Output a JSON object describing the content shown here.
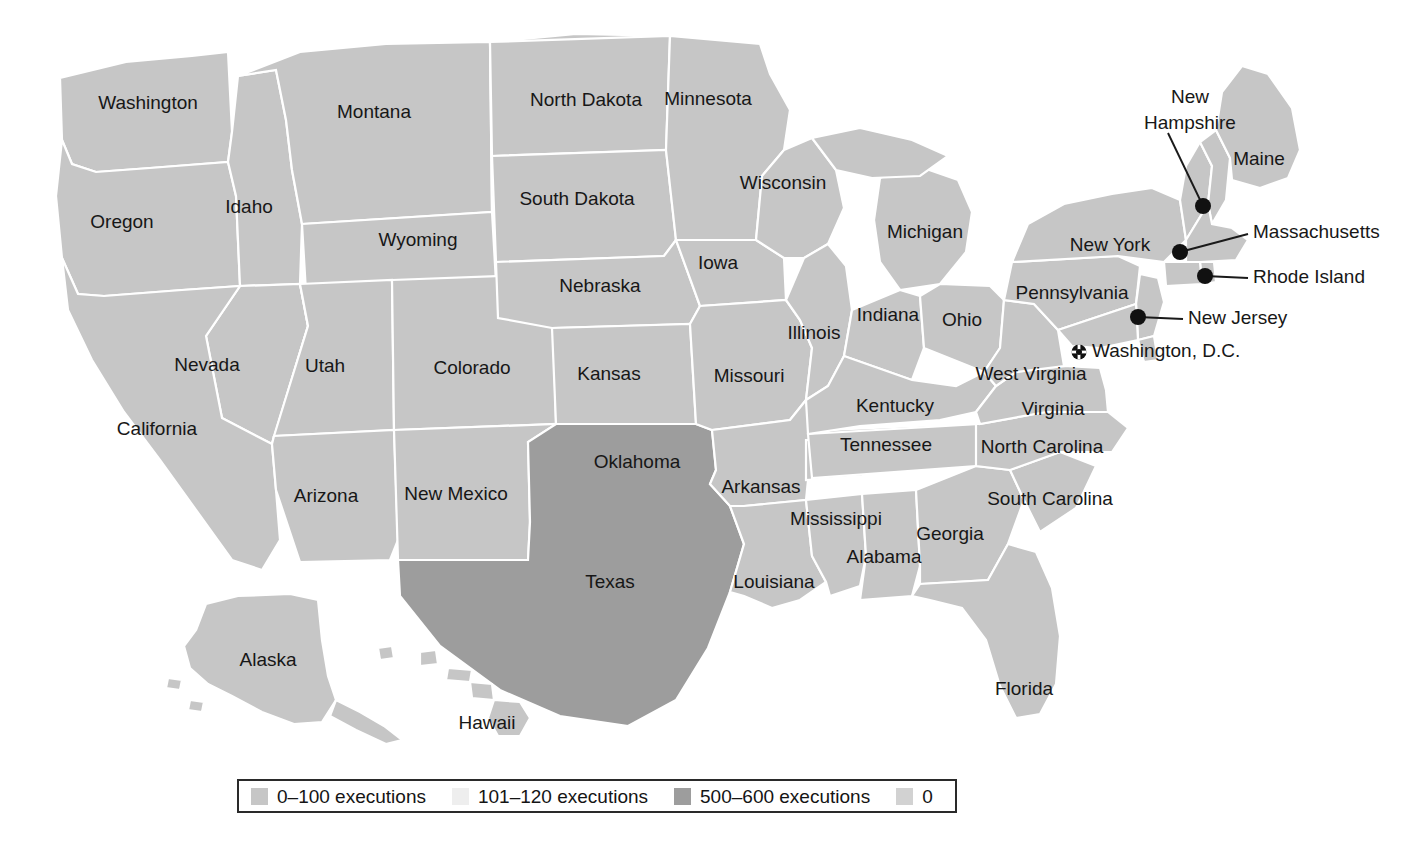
{
  "figure": {
    "kind": "choropleth-map",
    "region": "United States",
    "base_state_color": "#c6c6c6",
    "border_color": "#ffffff",
    "water_color": "#ffffff",
    "background_color": "#ffffff",
    "label_color": "#171717"
  },
  "legend": {
    "border_color": "#2a2a2a",
    "items": [
      {
        "label": "0–100 executions",
        "color": "#c6c6c6",
        "range": [
          0,
          100
        ]
      },
      {
        "label": "101–120 executions",
        "color": "#eeeeee",
        "range": [
          101,
          120
        ]
      },
      {
        "label": "500–600 executions",
        "color": "#9d9d9d",
        "range": [
          500,
          600
        ]
      },
      {
        "label": "0",
        "color": "#d2d2d2",
        "range": [
          0,
          0
        ]
      }
    ]
  },
  "map_data": {
    "type": "choropleth",
    "categories": [
      "0–100 executions",
      "101–120 executions",
      "500–600 executions",
      "0"
    ],
    "states": [
      {
        "name": "Washington",
        "label": "Washington",
        "category": "0–100 executions",
        "fill": "#c6c6c6",
        "label_x": 148,
        "label_y": 104
      },
      {
        "name": "Oregon",
        "label": "Oregon",
        "category": "0–100 executions",
        "fill": "#c6c6c6",
        "label_x": 122,
        "label_y": 223
      },
      {
        "name": "Idaho",
        "label": "Idaho",
        "category": "0–100 executions",
        "fill": "#c6c6c6",
        "label_x": 249,
        "label_y": 208
      },
      {
        "name": "Montana",
        "label": "Montana",
        "category": "0–100 executions",
        "fill": "#c6c6c6",
        "label_x": 374,
        "label_y": 113
      },
      {
        "name": "Wyoming",
        "label": "Wyoming",
        "category": "0–100 executions",
        "fill": "#c6c6c6",
        "label_x": 418,
        "label_y": 241
      },
      {
        "name": "North Dakota",
        "label": "North Dakota",
        "category": "0–100 executions",
        "fill": "#c6c6c6",
        "label_x": 586,
        "label_y": 101
      },
      {
        "name": "South Dakota",
        "label": "South Dakota",
        "category": "0–100 executions",
        "fill": "#c6c6c6",
        "label_x": 577,
        "label_y": 200
      },
      {
        "name": "Nebraska",
        "label": "Nebraska",
        "category": "0–100 executions",
        "fill": "#c6c6c6",
        "label_x": 600,
        "label_y": 287
      },
      {
        "name": "Minnesota",
        "label": "Minnesota",
        "category": "0–100 executions",
        "fill": "#c6c6c6",
        "label_x": 708,
        "label_y": 100
      },
      {
        "name": "Wisconsin",
        "label": "Wisconsin",
        "category": "0–100 executions",
        "fill": "#c6c6c6",
        "label_x": 783,
        "label_y": 184
      },
      {
        "name": "Iowa",
        "label": "Iowa",
        "category": "0–100 executions",
        "fill": "#c6c6c6",
        "label_x": 718,
        "label_y": 264
      },
      {
        "name": "Nevada",
        "label": "Nevada",
        "category": "0–100 executions",
        "fill": "#c6c6c6",
        "label_x": 207,
        "label_y": 366
      },
      {
        "name": "Utah",
        "label": "Utah",
        "category": "0–100 executions",
        "fill": "#c6c6c6",
        "label_x": 325,
        "label_y": 367
      },
      {
        "name": "Colorado",
        "label": "Colorado",
        "category": "0–100 executions",
        "fill": "#c6c6c6",
        "label_x": 472,
        "label_y": 369
      },
      {
        "name": "Kansas",
        "label": "Kansas",
        "category": "0–100 executions",
        "fill": "#c6c6c6",
        "label_x": 609,
        "label_y": 375
      },
      {
        "name": "California",
        "label": "California",
        "category": "0–100 executions",
        "fill": "#c6c6c6",
        "label_x": 157,
        "label_y": 430
      },
      {
        "name": "Arizona",
        "label": "Arizona",
        "category": "0–100 executions",
        "fill": "#c6c6c6",
        "label_x": 326,
        "label_y": 497
      },
      {
        "name": "New Mexico",
        "label": "New Mexico",
        "category": "0–100 executions",
        "fill": "#c6c6c6",
        "label_x": 456,
        "label_y": 495
      },
      {
        "name": "Oklahoma",
        "label": "Oklahoma",
        "category": "101–120 executions",
        "fill": "#eeeeee",
        "label_x": 637,
        "label_y": 463
      },
      {
        "name": "Texas",
        "label": "Texas",
        "category": "500–600 executions",
        "fill": "#9d9d9d",
        "label_x": 610,
        "label_y": 583
      },
      {
        "name": "Missouri",
        "label": "Missouri",
        "category": "0–100 executions",
        "fill": "#c6c6c6",
        "label_x": 749,
        "label_y": 377
      },
      {
        "name": "Arkansas",
        "label": "Arkansas",
        "category": "0–100 executions",
        "fill": "#c6c6c6",
        "label_x": 761,
        "label_y": 488
      },
      {
        "name": "Louisiana",
        "label": "Louisiana",
        "category": "0–100 executions",
        "fill": "#c6c6c6",
        "label_x": 774,
        "label_y": 583
      },
      {
        "name": "Mississippi",
        "label": "Mississippi",
        "category": "0–100 executions",
        "fill": "#c6c6c6",
        "label_x": 836,
        "label_y": 520
      },
      {
        "name": "Alabama",
        "label": "Alabama",
        "category": "0–100 executions",
        "fill": "#c6c6c6",
        "label_x": 884,
        "label_y": 558
      },
      {
        "name": "Georgia",
        "label": "Georgia",
        "category": "0–100 executions",
        "fill": "#c6c6c6",
        "label_x": 950,
        "label_y": 535
      },
      {
        "name": "Florida",
        "label": "Florida",
        "category": "0–100 executions",
        "fill": "#c6c6c6",
        "label_x": 1024,
        "label_y": 690
      },
      {
        "name": "Tennessee",
        "label": "Tennessee",
        "category": "0–100 executions",
        "fill": "#c6c6c6",
        "label_x": 886,
        "label_y": 446
      },
      {
        "name": "Kentucky",
        "label": "Kentucky",
        "category": "0–100 executions",
        "fill": "#c6c6c6",
        "label_x": 895,
        "label_y": 407
      },
      {
        "name": "Illinois",
        "label": "Illinois",
        "category": "0–100 executions",
        "fill": "#c6c6c6",
        "label_x": 814,
        "label_y": 334
      },
      {
        "name": "Indiana",
        "label": "Indiana",
        "category": "0–100 executions",
        "fill": "#c6c6c6",
        "label_x": 888,
        "label_y": 316
      },
      {
        "name": "Ohio",
        "label": "Ohio",
        "category": "0–100 executions",
        "fill": "#c6c6c6",
        "label_x": 962,
        "label_y": 321
      },
      {
        "name": "Michigan",
        "label": "Michigan",
        "category": "0–100 executions",
        "fill": "#c6c6c6",
        "label_x": 925,
        "label_y": 233
      },
      {
        "name": "North Carolina",
        "label": "North Carolina",
        "category": "0–100 executions",
        "fill": "#c6c6c6",
        "label_x": 1042,
        "label_y": 448
      },
      {
        "name": "South Carolina",
        "label": "South Carolina",
        "category": "0–100 executions",
        "fill": "#c6c6c6",
        "label_x": 1050,
        "label_y": 500
      },
      {
        "name": "Virginia",
        "label": "Virginia",
        "category": "0–100 executions",
        "fill": "#c6c6c6",
        "label_x": 1053,
        "label_y": 410
      },
      {
        "name": "West Virginia",
        "label": "West Virginia",
        "category": "0–100 executions",
        "fill": "#c6c6c6",
        "label_x": 1031,
        "label_y": 375
      },
      {
        "name": "Pennsylvania",
        "label": "Pennsylvania",
        "category": "0–100 executions",
        "fill": "#c6c6c6",
        "label_x": 1072,
        "label_y": 294
      },
      {
        "name": "New York",
        "label": "New York",
        "category": "0–100 executions",
        "fill": "#c6c6c6",
        "label_x": 1110,
        "label_y": 246
      },
      {
        "name": "Maine",
        "label": "Maine",
        "category": "0–100 executions",
        "fill": "#c6c6c6",
        "label_x": 1259,
        "label_y": 160
      },
      {
        "name": "Alaska",
        "label": "Alaska",
        "category": "0–100 executions",
        "fill": "#c6c6c6",
        "label_x": 268,
        "label_y": 661
      },
      {
        "name": "Hawaii",
        "label": "Hawaii",
        "category": "0–100 executions",
        "fill": "#c6c6c6",
        "label_x": 487,
        "label_y": 724
      }
    ],
    "callouts": [
      {
        "name": "New Hampshire",
        "label": "New Hampshire",
        "label_lines": [
          "New",
          "Hampshire"
        ],
        "category": "0–100 executions",
        "dot_x": 1203,
        "dot_y": 206,
        "text_x": 1190,
        "text_y": 98,
        "line_x2": 1168,
        "line_y2": 133
      },
      {
        "name": "Massachusetts",
        "label": "Massachusetts",
        "label_lines": [
          "Massachusetts"
        ],
        "category": "0–100 executions",
        "dot_x": 1180,
        "dot_y": 252,
        "text_x": 1253,
        "text_y": 233,
        "line_x2": 1248,
        "line_y2": 234
      },
      {
        "name": "Rhode Island",
        "label": "Rhode Island",
        "label_lines": [
          "Rhode Island"
        ],
        "category": "0–100 executions",
        "dot_x": 1205,
        "dot_y": 276,
        "text_x": 1253,
        "text_y": 278,
        "line_x2": 1248,
        "line_y2": 278
      },
      {
        "name": "New Jersey",
        "label": "New Jersey",
        "label_lines": [
          "New Jersey"
        ],
        "category": "0–100 executions",
        "dot_x": 1138,
        "dot_y": 317,
        "text_x": 1188,
        "text_y": 319,
        "line_x2": 1183,
        "line_y2": 319
      }
    ],
    "markers": [
      {
        "name": "Washington, D.C.",
        "label": "Washington, D.C.",
        "marker": "capital-marker",
        "x": 1079,
        "y": 352,
        "text_x": 1092,
        "text_y": 352
      }
    ]
  }
}
